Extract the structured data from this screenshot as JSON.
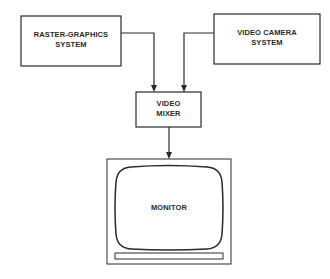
{
  "diagram": {
    "nodes": {
      "raster": {
        "line1": "RASTER-GRAPHICS",
        "line2": "SYSTEM"
      },
      "camera": {
        "line1": "VIDEO CAMERA",
        "line2": "SYSTEM"
      },
      "mixer": {
        "line1": "VIDEO",
        "line2": "MIXER"
      },
      "monitor": {
        "label": "MONITOR"
      }
    },
    "edges": [
      {
        "from": "RASTER-GRAPHICS SYSTEM",
        "to": "VIDEO MIXER"
      },
      {
        "from": "VIDEO CAMERA SYSTEM",
        "to": "VIDEO MIXER"
      },
      {
        "from": "VIDEO MIXER",
        "to": "MONITOR"
      }
    ],
    "colors": {
      "stroke": "#2a2a2a",
      "background": "#ffffff"
    }
  }
}
